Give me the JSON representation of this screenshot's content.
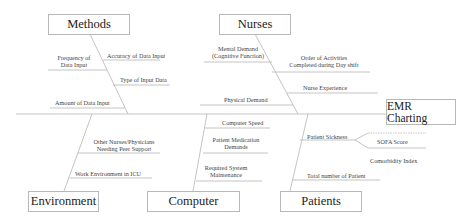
{
  "diagram": {
    "type": "fishbone",
    "effect": "EMR Charting",
    "categories": {
      "methods": {
        "label": "Methods",
        "causes": [
          "Accuracy of Data Input",
          "Frequency of Data Input",
          "Type of Input Data",
          "Amount of Data Input"
        ]
      },
      "nurses": {
        "label": "Nurses",
        "causes": [
          "Mental Demand (Cognitive Function)",
          "Order of Activities Completed during Day shift",
          "Nurse Experience",
          "Physical Demand"
        ]
      },
      "environment": {
        "label": "Environment",
        "causes": [
          "Other Nurses/Physicians Needing Peer Support",
          "Work Environment in ICU"
        ]
      },
      "computer": {
        "label": "Computer",
        "causes": [
          "Computer Speed",
          "Patient Medication Demands",
          "Required System Maintenance"
        ]
      },
      "patients": {
        "label": "Patients",
        "causes": [
          "Patient Sickness",
          "SOFA Score",
          "Comorbidity Index",
          "Total number of Patient"
        ]
      }
    },
    "labels": {
      "m_accuracy": "Accuracy of Data Input",
      "m_freq_1": "Frequency of",
      "m_freq_2": "Data Input",
      "m_type": "Type of Input Data",
      "m_amount": "Amount of Data Input",
      "n_mental_1": "Mental Demand",
      "n_mental_2": "(Cognitive Function)",
      "n_order_1": "Order of Activities",
      "n_order_2": "Completed during Day shift",
      "n_exp": "Nurse Experience",
      "n_phys": "Physical Demand",
      "e_other_1": "Other Nurses/Physicians",
      "e_other_2": "Needing Peer Support",
      "e_work": "Work Environment in ICU",
      "c_speed": "Computer Speed",
      "c_med_1": "Patient Medication",
      "c_med_2": "Demands",
      "c_maint_1": "Required System",
      "c_maint_2": "Maintenance",
      "p_sick": "Patient Sickness",
      "p_sofa": "SOFA Score",
      "p_comorb": "Comorbidity Index",
      "p_total": "Total number of Patient"
    }
  }
}
